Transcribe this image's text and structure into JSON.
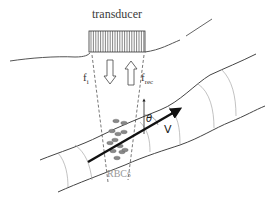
{
  "diagram": {
    "labels": {
      "transducer": "transducer",
      "f_incident_base": "f",
      "f_incident_sub": "i",
      "f_received_base": "f",
      "f_received_sub": "rec",
      "theta": "θ",
      "velocity": "V",
      "rbcs": "RBCs"
    },
    "components": [
      {
        "name": "transducer",
        "type": "ultrasound probe"
      },
      {
        "name": "skin-surface",
        "type": "tissue boundary"
      },
      {
        "name": "blood-vessel",
        "type": "tube"
      },
      {
        "name": "ultrasound-beam",
        "type": "dashed beam boundaries"
      },
      {
        "name": "incident-wave-arrow",
        "direction": "down"
      },
      {
        "name": "received-wave-arrow",
        "direction": "up"
      },
      {
        "name": "velocity-vector",
        "direction": "along vessel"
      },
      {
        "name": "red-blood-cells",
        "count": 12
      }
    ],
    "colors": {
      "line": "#444444",
      "light_line": "#999999",
      "vector": "#111111",
      "rbc_fill": "#888888",
      "rbc_label": "#999999"
    }
  }
}
